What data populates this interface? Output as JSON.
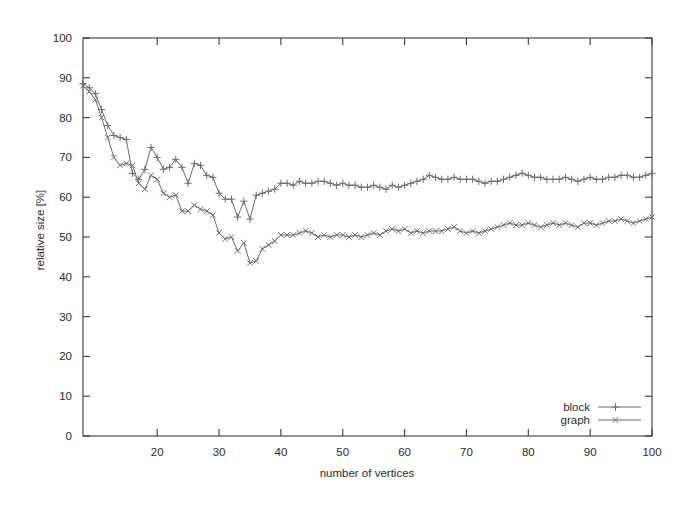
{
  "chart_data": {
    "type": "line",
    "title": "",
    "xlabel": "number of vertices",
    "ylabel": "relative size [%]",
    "xlim": [
      8,
      100
    ],
    "ylim": [
      0,
      100
    ],
    "xticks": [
      20,
      30,
      40,
      50,
      60,
      70,
      80,
      90,
      100
    ],
    "yticks": [
      0,
      10,
      20,
      30,
      40,
      50,
      60,
      70,
      80,
      90,
      100
    ],
    "grid": false,
    "legend_position": "bottom-right",
    "x": [
      8,
      9,
      10,
      11,
      12,
      13,
      14,
      15,
      16,
      17,
      18,
      19,
      20,
      21,
      22,
      23,
      24,
      25,
      26,
      27,
      28,
      29,
      30,
      31,
      32,
      33,
      34,
      35,
      36,
      37,
      38,
      39,
      40,
      41,
      42,
      43,
      44,
      45,
      46,
      47,
      48,
      49,
      50,
      51,
      52,
      53,
      54,
      55,
      56,
      57,
      58,
      59,
      60,
      61,
      62,
      63,
      64,
      65,
      66,
      67,
      68,
      69,
      70,
      71,
      72,
      73,
      74,
      75,
      76,
      77,
      78,
      79,
      80,
      81,
      82,
      83,
      84,
      85,
      86,
      87,
      88,
      89,
      90,
      91,
      92,
      93,
      94,
      95,
      96,
      97,
      98,
      99,
      100
    ],
    "series": [
      {
        "name": "block",
        "marker": "plus",
        "color": "#6b6b6b",
        "values": [
          88.5,
          87.5,
          86.0,
          82.0,
          78.0,
          75.5,
          75.0,
          74.5,
          66.0,
          64.5,
          67.0,
          72.5,
          70.0,
          67.0,
          67.5,
          69.5,
          67.5,
          63.5,
          68.5,
          68.0,
          65.5,
          65.0,
          61.0,
          59.5,
          59.5,
          55.0,
          59.0,
          54.5,
          60.5,
          61.0,
          61.5,
          62.0,
          63.5,
          63.5,
          63.0,
          64.0,
          63.5,
          63.5,
          64.0,
          64.0,
          63.5,
          63.0,
          63.5,
          63.0,
          63.0,
          62.5,
          62.5,
          63.0,
          62.5,
          62.0,
          63.0,
          62.5,
          63.0,
          63.5,
          64.0,
          64.5,
          65.5,
          65.0,
          64.5,
          64.5,
          65.0,
          64.5,
          64.5,
          64.5,
          64.0,
          63.5,
          64.0,
          64.0,
          64.5,
          65.0,
          65.5,
          66.0,
          65.5,
          65.0,
          65.0,
          64.5,
          64.5,
          64.5,
          65.0,
          64.5,
          64.0,
          64.5,
          65.0,
          64.5,
          64.5,
          65.0,
          65.0,
          65.5,
          65.5,
          65.0,
          65.0,
          65.5,
          66.0
        ]
      },
      {
        "name": "graph",
        "marker": "cross",
        "color": "#6b6b6b",
        "values": [
          88.0,
          86.5,
          84.5,
          80.0,
          75.0,
          70.0,
          68.0,
          68.5,
          68.0,
          63.5,
          62.0,
          65.5,
          64.5,
          61.0,
          60.0,
          60.5,
          56.5,
          56.5,
          58.0,
          57.0,
          56.5,
          55.5,
          51.0,
          49.5,
          50.0,
          46.5,
          48.5,
          43.5,
          44.0,
          47.0,
          48.0,
          49.0,
          50.5,
          50.5,
          50.5,
          51.0,
          51.5,
          51.0,
          50.0,
          50.5,
          50.0,
          50.5,
          50.5,
          50.0,
          50.5,
          50.0,
          50.5,
          51.0,
          50.5,
          51.5,
          52.0,
          51.5,
          52.0,
          51.0,
          51.5,
          51.0,
          51.5,
          51.5,
          51.5,
          52.0,
          52.5,
          51.5,
          51.0,
          51.5,
          51.0,
          51.5,
          52.0,
          52.5,
          53.0,
          53.5,
          53.0,
          53.0,
          53.5,
          53.0,
          52.5,
          53.0,
          53.5,
          53.0,
          53.5,
          53.0,
          52.5,
          53.5,
          53.5,
          53.0,
          53.5,
          54.0,
          54.0,
          54.5,
          54.0,
          53.5,
          54.0,
          54.5,
          55.0
        ]
      }
    ]
  },
  "axes": {
    "xlabel": "number of vertices",
    "ylabel": "relative size [%]",
    "xtick_labels": [
      "20",
      "30",
      "40",
      "50",
      "60",
      "70",
      "80",
      "90",
      "100"
    ],
    "ytick_labels": [
      "0",
      "10",
      "20",
      "30",
      "40",
      "50",
      "60",
      "70",
      "80",
      "90",
      "100"
    ]
  },
  "legend": {
    "entries": [
      {
        "label": "block",
        "marker": "plus"
      },
      {
        "label": "graph",
        "marker": "cross"
      }
    ]
  },
  "colors": {
    "line": "#6b6b6b",
    "axis": "#3a3a3a",
    "text": "#2b2b2b",
    "background": "#ffffff"
  }
}
